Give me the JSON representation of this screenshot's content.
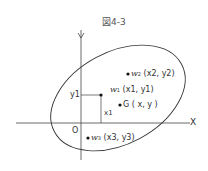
{
  "figure": {
    "title": "図4-3",
    "axes": {
      "x_label": "X",
      "origin_label": "O",
      "y_mark": "y1",
      "x_mark": "x1"
    },
    "points": [
      {
        "id": "w2",
        "name": "w",
        "sub": "2",
        "coords": "(x2, y2)"
      },
      {
        "id": "w1",
        "name": "w",
        "sub": "1",
        "coords": "(x1, y1)"
      },
      {
        "id": "G",
        "name": "G",
        "coords": "( x, y )"
      },
      {
        "id": "w3",
        "name": "w",
        "sub": "3",
        "coords": "(x3, y3)"
      }
    ]
  }
}
